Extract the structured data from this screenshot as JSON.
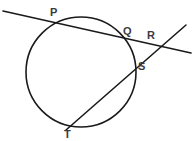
{
  "figure": {
    "background_color": "#ffffff",
    "stroke_color": "#1a1a1a",
    "label_color": "#3a3a3a",
    "width": 195,
    "height": 141
  },
  "circle": {
    "name": "circle",
    "center_x": 81,
    "center_y": 72,
    "radius": 55,
    "stroke_width": 1.6
  },
  "labels": {
    "p": "P",
    "q": "Q",
    "r": "R",
    "s": "S",
    "t": "T"
  },
  "label_positions": {
    "p": {
      "x": 50,
      "y": 7
    },
    "q": {
      "x": 123,
      "y": 26
    },
    "r": {
      "x": 147,
      "y": 30
    },
    "s": {
      "x": 138,
      "y": 61
    },
    "t": {
      "x": 64,
      "y": 129
    }
  },
  "points": {
    "p": {
      "x": 57,
      "y": 22,
      "on": "circle"
    },
    "q": {
      "x": 128,
      "y": 41,
      "on": "circle"
    },
    "r": {
      "x": 158,
      "y": 46,
      "on": "intersection-of-secants"
    },
    "s": {
      "x": 136,
      "y": 64,
      "on": "circle"
    },
    "t": {
      "x": 72,
      "y": 126,
      "on": "circle"
    }
  },
  "lines": [
    {
      "name": "secant-through-p-q-r",
      "x1": 3,
      "y1": 11,
      "x2": 191,
      "y2": 53,
      "stroke_width": 1.6
    },
    {
      "name": "secant-through-t-s-r",
      "x1": 66,
      "y1": 130,
      "x2": 186,
      "y2": 25,
      "stroke_width": 1.6
    }
  ]
}
